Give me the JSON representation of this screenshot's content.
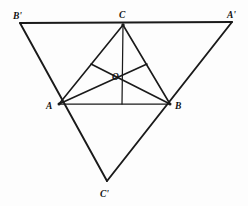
{
  "figure": {
    "width": 248,
    "height": 206,
    "background_color": "#fdfdfd",
    "line_color": "#1a1a1a"
  },
  "labels": {
    "B_prime": "B'",
    "C": "C",
    "A_prime": "A'",
    "A": "A",
    "B": "B",
    "O": "O",
    "C_prime": "C'"
  },
  "points": {
    "B_prime": {
      "x": 20,
      "y": 23
    },
    "A_prime": {
      "x": 232,
      "y": 22
    },
    "C_prime": {
      "x": 107,
      "y": 181
    },
    "A": {
      "x": 59,
      "y": 104
    },
    "B": {
      "x": 170,
      "y": 104
    },
    "C": {
      "x": 123,
      "y": 25
    },
    "O": {
      "x": 122,
      "y": 72
    },
    "midpoint_CA": {
      "x": 91,
      "y": 64
    },
    "midpoint_CB": {
      "x": 147,
      "y": 64
    },
    "midpoint_AB": {
      "x": 122,
      "y": 104
    }
  },
  "label_positions": {
    "B_prime": {
      "x": 13,
      "y": 19
    },
    "C": {
      "x": 120,
      "y": 18
    },
    "A_prime": {
      "x": 227,
      "y": 18
    },
    "A": {
      "x": 47,
      "y": 109
    },
    "B": {
      "x": 175,
      "y": 109
    },
    "O": {
      "x": 112,
      "y": 80
    },
    "C_prime": {
      "x": 101,
      "y": 196
    }
  },
  "segments": {
    "outer_triangle": [
      {
        "name": "B-prime-to-A-prime",
        "from": "B_prime",
        "to": "A_prime"
      },
      {
        "name": "B-prime-to-C-prime",
        "from": "B_prime",
        "to": "C_prime"
      },
      {
        "name": "A-prime-to-C-prime",
        "from": "A_prime",
        "to": "C_prime"
      }
    ],
    "inner_triangle": [
      {
        "name": "side-AB",
        "from": "A",
        "to": "B"
      },
      {
        "name": "side-AC",
        "from": "A",
        "to": "C"
      },
      {
        "name": "side-BC",
        "from": "B",
        "to": "C"
      }
    ],
    "medians": [
      {
        "name": "median-from-C",
        "from": "C",
        "to": "midpoint_AB"
      },
      {
        "name": "median-from-A",
        "from": "A",
        "to": "midpoint_CB"
      },
      {
        "name": "median-from-B",
        "from": "B",
        "to": "midpoint_CA"
      }
    ]
  }
}
